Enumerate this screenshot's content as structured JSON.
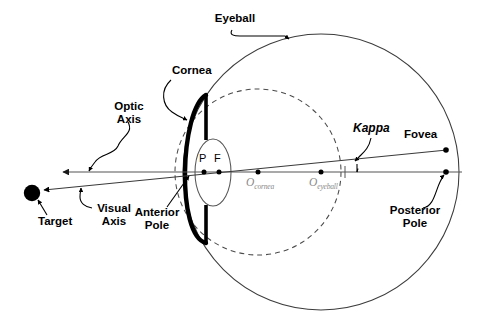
{
  "diagram": {
    "labels": {
      "eyeball": "Eyeball",
      "cornea": "Cornea",
      "optic_axis": "Optic\nAxis",
      "visual_axis": "Visual\nAxis",
      "target": "Target",
      "anterior_pole": "Anterior\nPole",
      "posterior_pole": "Posterior\nPole",
      "fovea": "Fovea",
      "kappa": "Kappa",
      "point_p": "P",
      "point_f": "F",
      "o_cornea_base": "O",
      "o_cornea_sub": "cornea",
      "o_eyeball_base": "O",
      "o_eyeball_sub": "eyeball"
    },
    "colors": {
      "stroke": "#000000",
      "eyeball_outline": "#3a3a3a",
      "dashed_cornea_sphere": "#4a4a4a",
      "axis_line": "#555555",
      "label_gray": "#8a8a8a",
      "background": "#ffffff"
    },
    "geometry": {
      "eyeball_center": [
        321,
        172
      ],
      "eyeball_radius": 138,
      "cornea_sphere_center": [
        258,
        172
      ],
      "cornea_sphere_radius": 83,
      "optic_axis_y": 172,
      "target_point": [
        32,
        193
      ],
      "target_radius": 8,
      "fovea_point": [
        445,
        150
      ],
      "posterior_pole_point": [
        445,
        172
      ],
      "anterior_pole_point": [
        188,
        172
      ],
      "point_p": [
        204,
        172
      ],
      "point_f": [
        218,
        172
      ],
      "o_cornea_point": [
        258,
        172
      ],
      "o_eyeball_point": [
        321,
        172
      ],
      "kappa_angle_deg": 5
    }
  }
}
